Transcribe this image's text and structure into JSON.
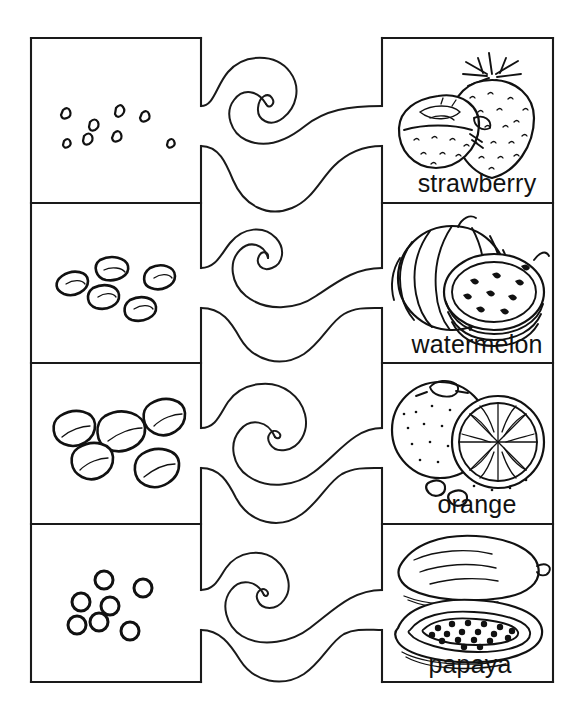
{
  "worksheet": {
    "type": "match-the-seed-to-the-fruit",
    "width": 587,
    "height": 722,
    "ink_color": "#111111",
    "paper_color": "#ffffff"
  },
  "rows": [
    {
      "index": 1,
      "seed_panel": {
        "name": "strawberry-seeds",
        "seed_shape": "tiny-oval-specks",
        "seed_count": 8
      },
      "fruit_panel": {
        "name": "strawberry-picture",
        "label": "strawberry",
        "depicts": "whole strawberry with leafy calyx beside a halved strawberry"
      },
      "connector": "wavy-puzzle-link"
    },
    {
      "index": 2,
      "seed_panel": {
        "name": "watermelon-seeds",
        "seed_shape": "flat-teardrop",
        "seed_count": 5
      },
      "fruit_panel": {
        "name": "watermelon-picture",
        "label": "watermelon",
        "depicts": "striped whole watermelon with a round cut slice showing seeds"
      },
      "connector": "wavy-puzzle-link"
    },
    {
      "index": 3,
      "seed_panel": {
        "name": "orange-seeds",
        "seed_shape": "large-teardrop-pip",
        "seed_count": 5
      },
      "fruit_panel": {
        "name": "orange-picture",
        "label": "orange",
        "depicts": "whole dimpled orange with a halved orange showing segments and two loose pips"
      },
      "connector": "wavy-puzzle-link"
    },
    {
      "index": 4,
      "seed_panel": {
        "name": "papaya-seeds",
        "seed_shape": "round-ring",
        "seed_count": 7
      },
      "fruit_panel": {
        "name": "papaya-picture",
        "label": "papaya",
        "depicts": "whole papaya above a halved papaya filled with round seeds"
      },
      "connector": "wavy-puzzle-link"
    }
  ],
  "labels": {
    "row1": "strawberry",
    "row2": "watermelon",
    "row3": "orange",
    "row4": "papaya"
  }
}
